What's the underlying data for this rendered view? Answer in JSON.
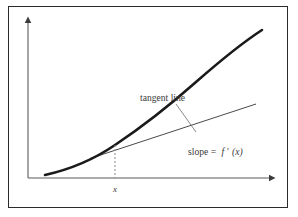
{
  "figure": {
    "background_color": "#ffffff",
    "frame": {
      "name": "figure-border",
      "color": "#2b2b2b",
      "x": 8,
      "y": 6,
      "width": 280,
      "height": 202
    }
  },
  "axes": {
    "color": "#5a5a5a",
    "origin": {
      "x": 28,
      "y": 178
    },
    "x_axis": {
      "from_x": 28,
      "to_x": 272,
      "y": 178,
      "arrow": "right"
    },
    "y_axis": {
      "x": 28,
      "from_y": 178,
      "to_y": 20,
      "arrow": "up"
    },
    "x_tick_label": "x",
    "x_tick_position": {
      "x": 115,
      "y": 190
    }
  },
  "curve": {
    "name": "function-curve",
    "color": "#1a1a1a",
    "stroke_width": 2.6,
    "description": "increasing convex curve",
    "points": [
      [
        45,
        175
      ],
      [
        70,
        168
      ],
      [
        95,
        157
      ],
      [
        115,
        145
      ],
      [
        140,
        129
      ],
      [
        165,
        110
      ],
      [
        190,
        88
      ],
      [
        215,
        66
      ],
      [
        240,
        46
      ],
      [
        262,
        30
      ]
    ]
  },
  "tangent": {
    "name": "tangent-line",
    "color": "#4a4a4a",
    "stroke_width": 1.0,
    "from": {
      "x": 90,
      "y": 158
    },
    "to": {
      "x": 256,
      "y": 104
    },
    "touch_point": {
      "x": 115,
      "y": 145
    },
    "label": "tangent line",
    "label_position": {
      "x": 140,
      "y": 101
    },
    "leader_from": {
      "x": 176,
      "y": 105
    },
    "leader_to": {
      "x": 196,
      "y": 131
    }
  },
  "dashed_drop_line": {
    "name": "x-drop-line",
    "color": "#8a8a8a",
    "dash": "2 2",
    "from": {
      "x": 115,
      "y": 145
    },
    "to": {
      "x": 115,
      "y": 178
    }
  },
  "annotations": {
    "slope_label_prefix": "slope =",
    "slope_label_function": "f",
    "slope_label_prime": "′",
    "slope_label_argument": "(x)",
    "slope_label_full": "slope = f ′(x)",
    "slope_position": {
      "x": 188,
      "y": 155
    }
  }
}
